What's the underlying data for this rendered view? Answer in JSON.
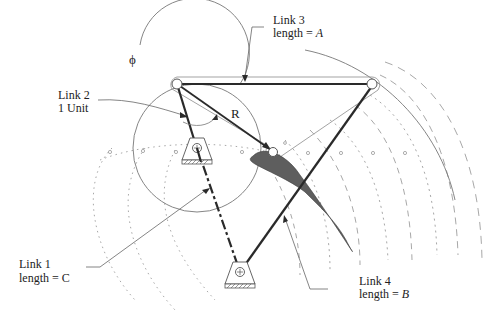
{
  "diagram": {
    "colors": {
      "link": "#2a2a2a",
      "thin": "#777777",
      "dotted": "#a8a8a8",
      "coupler_fill": "#5e5e5e",
      "text": "#222222"
    },
    "labels": {
      "link3": {
        "line1": "Link 3",
        "line2_prefix": "length = ",
        "line2_var": "A"
      },
      "link2": {
        "line1": "Link 2",
        "line2": "1 Unit"
      },
      "link1": {
        "line1": "Link 1",
        "line2_prefix": "length = ",
        "line2_var": "C"
      },
      "link4": {
        "line1": "Link 4",
        "line2_prefix": "length = ",
        "line2_var": "B"
      },
      "phi": "ϕ",
      "r": "R"
    },
    "joints": {
      "crank_coupler": [
        177,
        84
      ],
      "coupler_rocker": [
        372,
        84
      ],
      "ground_crank": [
        197,
        148
      ],
      "ground_rocker": [
        240,
        272
      ],
      "coupler_point": [
        273,
        151
      ]
    }
  }
}
